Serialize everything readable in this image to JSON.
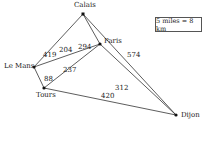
{
  "scale": {
    "label": "5 miles = 8 km"
  },
  "nodes": [
    {
      "id": "calais",
      "name": "Calais"
    },
    {
      "id": "paris",
      "name": "Paris"
    },
    {
      "id": "le_mans",
      "name": "Le Mans"
    },
    {
      "id": "tours",
      "name": "Tours"
    },
    {
      "id": "dijon",
      "name": "Dijon"
    }
  ],
  "edges": [
    {
      "from": "Calais",
      "to": "Le Mans",
      "weight": "419"
    },
    {
      "from": "Calais",
      "to": "Paris",
      "weight": "294"
    },
    {
      "from": "Calais",
      "to": "Dijon",
      "weight": "574"
    },
    {
      "from": "Le Mans",
      "to": "Paris",
      "weight": "204"
    },
    {
      "from": "Tours",
      "to": "Paris",
      "weight": "237"
    },
    {
      "from": "Le Mans",
      "to": "Tours",
      "weight": "88"
    },
    {
      "from": "Paris",
      "to": "Dijon",
      "weight": "312"
    },
    {
      "from": "Tours",
      "to": "Dijon",
      "weight": "420"
    }
  ]
}
